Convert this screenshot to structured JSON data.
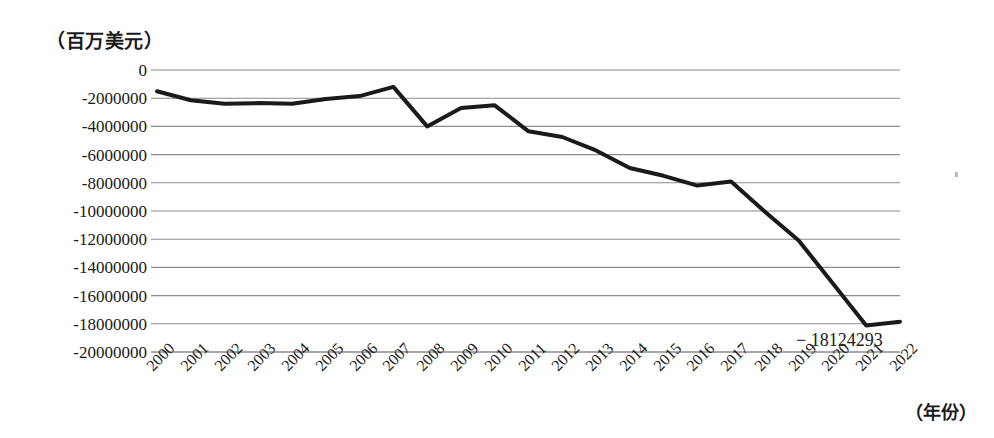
{
  "chart_data": {
    "type": "line",
    "title": "",
    "unit_label": "（百万美元）",
    "xlabel": "（年份）",
    "ylabel": "",
    "grid": true,
    "legend": "none",
    "xlim": [
      2000,
      2022
    ],
    "ylim": [
      -20000000,
      0
    ],
    "ytick_step": 2000000,
    "categories": [
      "2000",
      "2001",
      "2002",
      "2003",
      "2004",
      "2005",
      "2006",
      "2007",
      "2008",
      "2009",
      "2010",
      "2011",
      "2012",
      "2013",
      "2014",
      "2015",
      "2016",
      "2017",
      "2018",
      "2019",
      "2020",
      "2021",
      "2022"
    ],
    "ytick_labels": [
      "0",
      "-2000000",
      "-4000000",
      "-6000000",
      "-8000000",
      "-10000000",
      "-12000000",
      "-14000000",
      "-16000000",
      "-18000000",
      "-20000000"
    ],
    "ytick_values": [
      0,
      -2000000,
      -4000000,
      -6000000,
      -8000000,
      -10000000,
      -12000000,
      -14000000,
      -16000000,
      -18000000,
      -20000000
    ],
    "values": [
      -1500000,
      -2150000,
      -2400000,
      -2350000,
      -2400000,
      -2050000,
      -1850000,
      -1200000,
      -4000000,
      -2700000,
      -2500000,
      -4350000,
      -4750000,
      -5700000,
      -6950000,
      -7500000,
      -8200000,
      -7900000,
      -10050000,
      -12100000,
      -15100000,
      -18124293,
      -17850000
    ],
    "annotations": [
      {
        "text": "− 18124293",
        "at_category": "2021",
        "value": -18124293
      }
    ],
    "series": [
      {
        "name": "",
        "color": "#1a1a1a",
        "line_width": 4,
        "values": [
          -1500000,
          -2150000,
          -2400000,
          -2350000,
          -2400000,
          -2050000,
          -1850000,
          -1200000,
          -4000000,
          -2700000,
          -2500000,
          -4350000,
          -4750000,
          -5700000,
          -6950000,
          -7500000,
          -8200000,
          -7900000,
          -10050000,
          -12100000,
          -15100000,
          -18124293,
          -17850000
        ]
      }
    ]
  },
  "colors": {
    "line": "#1a1a1a",
    "grid": "#8c8c8c",
    "background": "#ffffff",
    "text": "#1a1a1a"
  }
}
